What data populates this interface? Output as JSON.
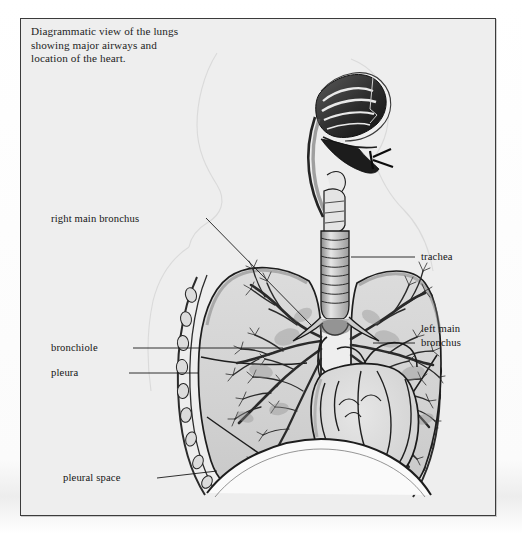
{
  "figure": {
    "caption_lines": [
      "Diagrammatic view of the lungs",
      "showing major airways and",
      "location of the heart."
    ],
    "style": "pen-and-ink anatomical illustration, grayscale"
  },
  "labels": [
    {
      "id": "right-main-bronchus",
      "text": "right main bronchus",
      "side": "left",
      "x": 50,
      "y": 221
    },
    {
      "id": "bronchiole",
      "text": "bronchiole",
      "side": "left",
      "x": 50,
      "y": 350
    },
    {
      "id": "pleura",
      "text": "pleura",
      "side": "left",
      "x": 50,
      "y": 375
    },
    {
      "id": "pleural-space",
      "text": "pleural space",
      "side": "left",
      "x": 62,
      "y": 480
    },
    {
      "id": "trachea",
      "text": "trachea",
      "side": "right",
      "x": 412,
      "y": 258
    },
    {
      "id": "left-main-bronchus-line1",
      "text": "left main",
      "side": "right",
      "x": 412,
      "y": 332
    },
    {
      "id": "left-main-bronchus-line2",
      "text": "bronchus",
      "side": "right",
      "x": 412,
      "y": 346
    }
  ],
  "anatomy_parts": [
    "nasal-cavity",
    "pharynx",
    "epiglottis",
    "larynx",
    "trachea",
    "right-main-bronchus",
    "left-main-bronchus",
    "bronchial-tree",
    "bronchiole",
    "right-lung",
    "left-lung",
    "pleura",
    "pleural-space",
    "rib-cage",
    "diaphragm",
    "heart",
    "great-vessels"
  ],
  "colors": {
    "page_background": "#ffffff",
    "panel_background": "#eeeeee",
    "frame_border": "#3b3b3b",
    "ink": "#1a1a1a",
    "tissue_fill": "#d6d6d6",
    "tissue_fill_light": "#e3e3e3",
    "shadow": "#8d8d8d"
  }
}
